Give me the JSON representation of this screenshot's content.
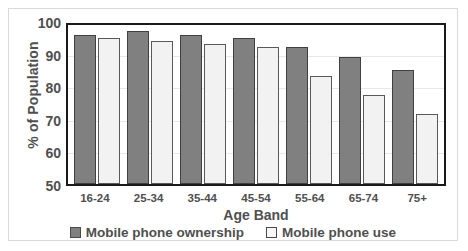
{
  "chart_data": {
    "type": "bar",
    "title": "",
    "xlabel": "Age Band",
    "ylabel": "% of Population",
    "categories": [
      "16-24",
      "25-34",
      "35-44",
      "45-54",
      "55-64",
      "65-74",
      "75+"
    ],
    "series": [
      {
        "name": "Mobile phone ownership",
        "color": "#808080",
        "values": [
          97,
          98,
          97,
          96,
          93,
          90,
          86
        ]
      },
      {
        "name": "Mobile phone use",
        "color": "#f2f2f2",
        "values": [
          96,
          95,
          94,
          93,
          84,
          78,
          72
        ]
      }
    ],
    "ylim": [
      50,
      100
    ],
    "yticks": [
      50,
      60,
      70,
      80,
      90,
      100
    ],
    "grid": true,
    "legend_position": "bottom"
  },
  "axes": {
    "y_title": "% of Population",
    "x_title": "Age Band",
    "y_tick_labels": [
      "100",
      "90",
      "80",
      "70",
      "60",
      "50"
    ],
    "x_tick_labels": [
      "16-24",
      "25-34",
      "35-44",
      "45-54",
      "55-64",
      "65-74",
      "75+"
    ]
  },
  "legend": {
    "items": [
      {
        "label": "Mobile phone ownership",
        "swatch": "filled-gray-square-icon"
      },
      {
        "label": "Mobile phone use",
        "swatch": "outlined-white-square-icon"
      }
    ]
  }
}
